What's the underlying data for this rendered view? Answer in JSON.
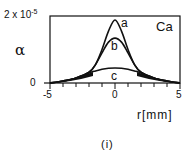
{
  "chart_data": {
    "type": "line",
    "title": "",
    "panel_label": "(i)",
    "element_label": "Ca",
    "xlabel": "r[mm]",
    "ylabel": "α",
    "xlim": [
      -5,
      5
    ],
    "ylim": [
      0,
      2e-05
    ],
    "xticks": [
      "-5",
      "0",
      "5"
    ],
    "yticks": [
      "0",
      "2 x 10^-5"
    ],
    "ytick_top_base": "2 x 10",
    "ytick_top_exp": "-5",
    "grid": false,
    "legend": "inline curve labels",
    "x": [
      -5,
      -4,
      -3,
      -2,
      -1.5,
      -1,
      -0.5,
      0,
      0.5,
      1,
      1.5,
      2,
      3,
      4,
      5
    ],
    "series": [
      {
        "name": "a",
        "values": [
          0.0,
          6e-07,
          1.5e-06,
          3.2e-06,
          5.5e-06,
          1e-05,
          1.55e-05,
          1.88e-05,
          1.55e-05,
          1e-05,
          5.5e-06,
          3.2e-06,
          1.5e-06,
          6e-07,
          0.0
        ]
      },
      {
        "name": "b",
        "values": [
          0.0,
          6e-07,
          1.5e-06,
          3.2e-06,
          5.5e-06,
          9e-06,
          1.22e-05,
          1.34e-05,
          1.22e-05,
          9e-06,
          5.5e-06,
          3.2e-06,
          1.5e-06,
          6e-07,
          0.0
        ]
      },
      {
        "name": "c",
        "values": [
          0.0,
          5e-07,
          1.4e-06,
          3e-06,
          3.6e-06,
          4.1e-06,
          4.4e-06,
          4.5e-06,
          4.4e-06,
          4.1e-06,
          3.6e-06,
          3e-06,
          1.4e-06,
          5e-07,
          0.0
        ]
      }
    ]
  }
}
